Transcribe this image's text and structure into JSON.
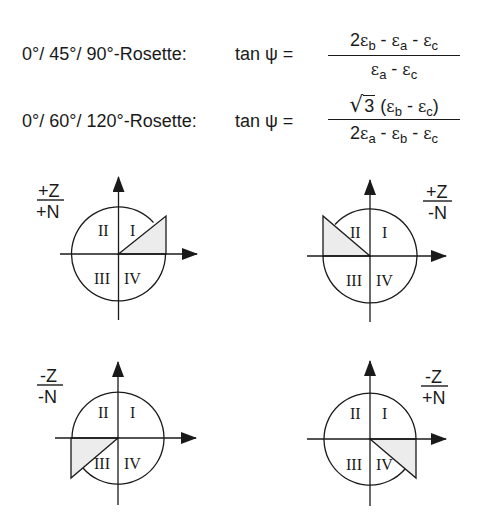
{
  "formulas": [
    {
      "rosette": "0°/ 45°/ 90°-Rosette:",
      "lhs": "tan ψ =",
      "numerator": {
        "parts": [
          {
            "coef": "2",
            "sym": "ε",
            "sub": "b"
          },
          {
            "op": " - ",
            "sym": "ε",
            "sub": "a"
          },
          {
            "op": " - ",
            "sym": "ε",
            "sub": "c"
          }
        ],
        "text": "2εb - εa - εc"
      },
      "denominator": {
        "text": "εa - εc"
      }
    },
    {
      "rosette": "0°/ 60°/ 120°-Rosette:",
      "lhs": "tan ψ =",
      "numerator": {
        "text": "√3 (εb - εc)",
        "sqrt_radicand": "3"
      },
      "denominator": {
        "text": "2εa - εb - εc"
      }
    }
  ],
  "diagrams": [
    {
      "id": "top-left",
      "sign_top": "+Z",
      "sign_bottom": "+N",
      "shaded_quadrant": "I",
      "quadrants": [
        "I",
        "II",
        "III",
        "IV"
      ]
    },
    {
      "id": "top-right",
      "sign_top": "+Z",
      "sign_bottom": "-N",
      "shaded_quadrant": "II",
      "quadrants": [
        "I",
        "II",
        "III",
        "IV"
      ]
    },
    {
      "id": "bottom-left",
      "sign_top": "-Z",
      "sign_bottom": "-N",
      "shaded_quadrant": "III",
      "quadrants": [
        "I",
        "II",
        "III",
        "IV"
      ]
    },
    {
      "id": "bottom-right",
      "sign_top": "-Z",
      "sign_bottom": "+N",
      "shaded_quadrant": "IV",
      "quadrants": [
        "I",
        "II",
        "III",
        "IV"
      ]
    }
  ],
  "colors": {
    "ink": "#1a1a1a",
    "shade": "#ececec",
    "background": "#ffffff"
  },
  "text": {
    "q1": "I",
    "q2": "II",
    "q3": "III",
    "q4": "IV",
    "eps": "ε",
    "a": "a",
    "b": "b",
    "c": "c",
    "two": "2",
    "minus": " - ",
    "sqrt_sym": "√",
    "three": "3",
    "paren_open": "(",
    "paren_close": ")"
  }
}
